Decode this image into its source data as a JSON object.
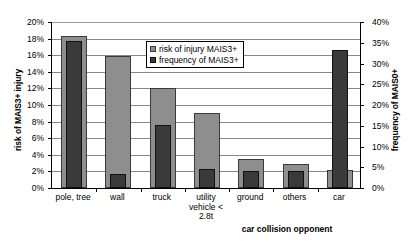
{
  "chart_data": {
    "type": "bar",
    "title": "",
    "xlabel": "car collision opponent",
    "ylabel": "risk of MAIS3+ injury",
    "y2label": "frequency of MAIS0+",
    "ylim": [
      0,
      20
    ],
    "y2lim": [
      0,
      40
    ],
    "grid": true,
    "legend_position": "top-center",
    "categories": [
      "pole, tree",
      "wall",
      "truck",
      "utility vehicle < 2.8t",
      "ground",
      "others",
      "car"
    ],
    "category_lines": [
      [
        "pole, tree"
      ],
      [
        "wall"
      ],
      [
        "truck"
      ],
      [
        "utility",
        "vehicle <",
        "2.8t"
      ],
      [
        "ground"
      ],
      [
        "others"
      ],
      [
        "car"
      ]
    ],
    "series": [
      {
        "name": "risk of injury MAIS3+",
        "axis": "left",
        "color": "#8e8e8e",
        "values": [
          18.3,
          15.9,
          12.1,
          9.0,
          3.5,
          2.9,
          2.2
        ]
      },
      {
        "name": "frequency of MAIS3+",
        "axis": "right",
        "color": "#3a3a3a",
        "values": [
          35.5,
          3.3,
          15.3,
          4.7,
          4.0,
          4.1,
          33.3
        ]
      }
    ],
    "y_ticks": [
      "20%",
      "18%",
      "16%",
      "14%",
      "12%",
      "10%",
      "8%",
      "6%",
      "4%",
      "2%",
      "0%"
    ],
    "y2_ticks": [
      "40%",
      "35%",
      "30%",
      "25%",
      "20%",
      "15%",
      "10%",
      "5%",
      "0%"
    ]
  },
  "legend": {
    "items": [
      {
        "label": "risk of injury MAIS3+"
      },
      {
        "label": "frequency of MAIS3+"
      }
    ]
  }
}
